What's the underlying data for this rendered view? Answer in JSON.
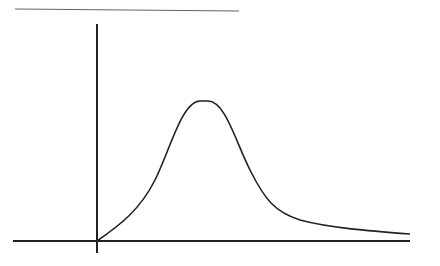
{
  "diagram": {
    "type": "skewed-bell-curve",
    "stroke_color": "#222222",
    "top_line_color": "#555555",
    "labels": []
  }
}
